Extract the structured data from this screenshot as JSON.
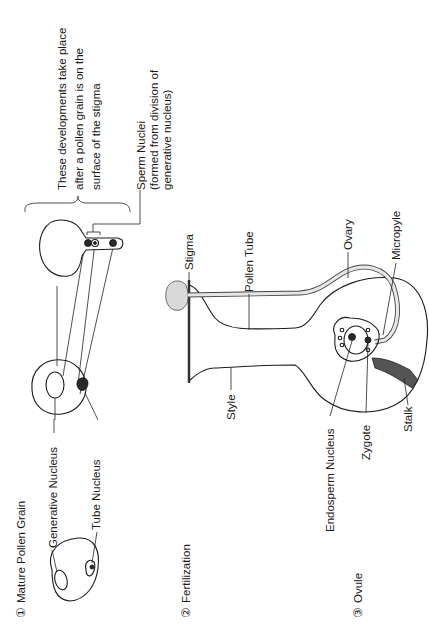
{
  "diagram": {
    "orientation": "rotated-90-ccw",
    "sections": [
      {
        "number": "①",
        "title": "Mature Pollen Grain"
      },
      {
        "number": "②",
        "title": "Fertilization"
      },
      {
        "number": "③",
        "title": "Ovule"
      }
    ],
    "pollen_labels": {
      "generative_nucleus": "Generative Nucleus",
      "tube_nucleus": "Tube Nucleus"
    },
    "note": {
      "line1": "These developments take place",
      "line2": "after a pollen grain is on the",
      "line3": "surface of the stigma"
    },
    "sperm_label": {
      "line1": "Sperm Nuclei",
      "line2": "(formed from division of",
      "line3": "generative nucleus)"
    },
    "flower_labels": {
      "stigma": "Stigma",
      "pollen_tube": "Pollen Tube",
      "style": "Style",
      "ovary": "Ovary",
      "micropyle": "Micropyle",
      "endosperm_nucleus": "Endosperm Nucleus",
      "zygote": "Zygote",
      "stalk": "Stalk"
    },
    "colors": {
      "line": "#1a1a1a",
      "background": "#ffffff",
      "stipple": "#d9d9d9"
    }
  }
}
